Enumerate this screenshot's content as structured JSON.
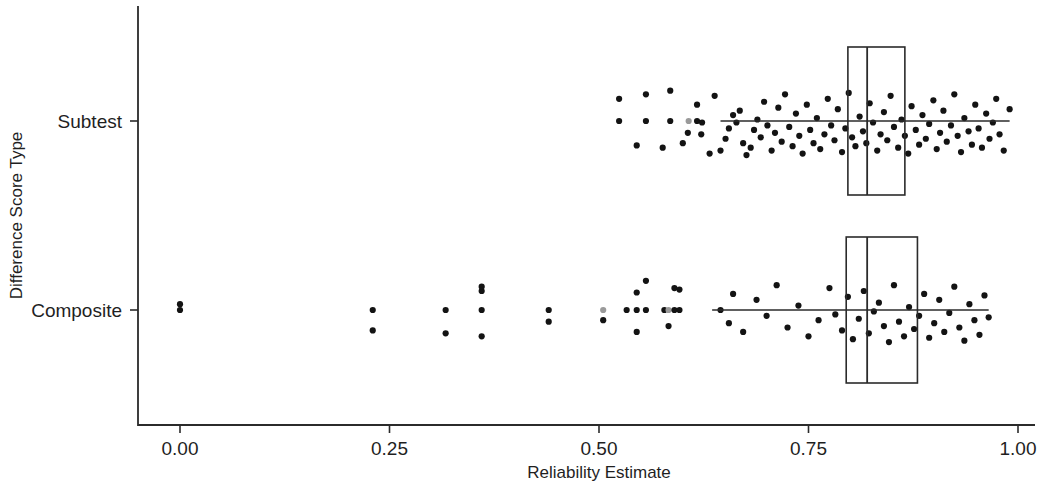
{
  "chart_data": {
    "type": "boxplot",
    "title": "",
    "xlabel": "Reliability Estimate",
    "ylabel": "Difference Score Type",
    "xlim": [
      -0.05,
      1.03
    ],
    "xticks": [
      0.0,
      0.25,
      0.5,
      0.75,
      1.0
    ],
    "xticklabels": [
      "0.00",
      "0.25",
      "0.50",
      "0.75",
      "1.00"
    ],
    "categories": [
      "Subtest",
      "Composite"
    ],
    "grid": false,
    "legend": "none",
    "point_color": "#131313",
    "line_color": "#2b2b2b",
    "box_fill": "none",
    "boxes": [
      {
        "category": "Subtest",
        "q1": 0.797,
        "median": 0.82,
        "q3": 0.865,
        "whisker_low": 0.645,
        "whisker_high": 0.99,
        "n_points": 430
      },
      {
        "category": "Composite",
        "q1": 0.795,
        "median": 0.82,
        "q3": 0.88,
        "whisker_low": 0.635,
        "whisker_high": 0.965,
        "n_points": 175
      }
    ],
    "points": {
      "Subtest": [
        [
          0.524,
          0.0
        ],
        [
          0.556,
          0.0
        ],
        [
          0.585,
          0.0
        ],
        [
          0.607,
          0.0
        ],
        [
          0.617,
          0.0
        ],
        [
          0.623,
          0.02
        ],
        [
          0.524,
          -0.3
        ],
        [
          0.556,
          -0.36
        ],
        [
          0.585,
          -0.41
        ],
        [
          0.617,
          -0.22
        ],
        [
          0.638,
          -0.34
        ],
        [
          0.545,
          0.33
        ],
        [
          0.576,
          0.36
        ],
        [
          0.6,
          0.3
        ],
        [
          0.606,
          0.16
        ],
        [
          0.622,
          0.18
        ],
        [
          0.632,
          0.44
        ],
        [
          0.645,
          0.4
        ],
        [
          0.651,
          0.24
        ],
        [
          0.655,
          0.1
        ],
        [
          0.66,
          -0.08
        ],
        [
          0.664,
          0.02
        ],
        [
          0.668,
          -0.14
        ],
        [
          0.672,
          0.3
        ],
        [
          0.676,
          0.46
        ],
        [
          0.681,
          0.36
        ],
        [
          0.685,
          0.12
        ],
        [
          0.689,
          -0.02
        ],
        [
          0.693,
          0.22
        ],
        [
          0.697,
          -0.26
        ],
        [
          0.701,
          0.06
        ],
        [
          0.706,
          0.4
        ],
        [
          0.71,
          0.16
        ],
        [
          0.714,
          -0.18
        ],
        [
          0.718,
          0.28
        ],
        [
          0.722,
          -0.36
        ],
        [
          0.727,
          0.08
        ],
        [
          0.731,
          0.34
        ],
        [
          0.735,
          -0.1
        ],
        [
          0.739,
          0.2
        ],
        [
          0.743,
          0.44
        ],
        [
          0.748,
          -0.22
        ],
        [
          0.752,
          0.12
        ],
        [
          0.756,
          0.3
        ],
        [
          0.76,
          -0.04
        ],
        [
          0.764,
          0.38
        ],
        [
          0.769,
          0.18
        ],
        [
          0.773,
          -0.3
        ],
        [
          0.777,
          0.06
        ],
        [
          0.781,
          0.26
        ],
        [
          0.785,
          -0.16
        ],
        [
          0.79,
          0.42
        ],
        [
          0.794,
          0.1
        ],
        [
          0.798,
          -0.38
        ],
        [
          0.802,
          0.22
        ],
        [
          0.806,
          0.34
        ],
        [
          0.811,
          -0.06
        ],
        [
          0.815,
          0.14
        ],
        [
          0.819,
          0.3
        ],
        [
          0.823,
          -0.24
        ],
        [
          0.827,
          0.02
        ],
        [
          0.832,
          0.4
        ],
        [
          0.836,
          0.18
        ],
        [
          0.84,
          -0.12
        ],
        [
          0.844,
          0.26
        ],
        [
          0.848,
          -0.34
        ],
        [
          0.852,
          0.08
        ],
        [
          0.857,
          0.36
        ],
        [
          0.861,
          -0.02
        ],
        [
          0.865,
          0.2
        ],
        [
          0.869,
          0.44
        ],
        [
          0.873,
          -0.2
        ],
        [
          0.878,
          0.12
        ],
        [
          0.882,
          0.32
        ],
        [
          0.886,
          -0.08
        ],
        [
          0.89,
          0.24
        ],
        [
          0.894,
          0.04
        ],
        [
          0.899,
          -0.28
        ],
        [
          0.903,
          0.38
        ],
        [
          0.907,
          0.16
        ],
        [
          0.911,
          -0.14
        ],
        [
          0.915,
          0.28
        ],
        [
          0.92,
          0.06
        ],
        [
          0.924,
          -0.36
        ],
        [
          0.928,
          0.2
        ],
        [
          0.932,
          0.42
        ],
        [
          0.936,
          -0.04
        ],
        [
          0.941,
          0.14
        ],
        [
          0.945,
          0.32
        ],
        [
          0.949,
          -0.22
        ],
        [
          0.953,
          0.1
        ],
        [
          0.957,
          0.36
        ],
        [
          0.962,
          -0.1
        ],
        [
          0.966,
          0.24
        ],
        [
          0.97,
          0.02
        ],
        [
          0.974,
          -0.3
        ],
        [
          0.978,
          0.18
        ],
        [
          0.983,
          0.4
        ],
        [
          0.99,
          -0.16
        ]
      ],
      "Composite": [
        [
          0.0,
          0.0
        ],
        [
          0.0,
          -0.08
        ],
        [
          0.23,
          0.0
        ],
        [
          0.23,
          0.28
        ],
        [
          0.317,
          0.0
        ],
        [
          0.317,
          0.32
        ],
        [
          0.36,
          0.0
        ],
        [
          0.36,
          0.36
        ],
        [
          0.36,
          -0.26
        ],
        [
          0.36,
          -0.32
        ],
        [
          0.44,
          0.0
        ],
        [
          0.44,
          0.16
        ],
        [
          0.505,
          0.0
        ],
        [
          0.505,
          0.14
        ],
        [
          0.533,
          0.0
        ],
        [
          0.545,
          0.0
        ],
        [
          0.556,
          0.0
        ],
        [
          0.545,
          0.3
        ],
        [
          0.545,
          -0.24
        ],
        [
          0.556,
          -0.4
        ],
        [
          0.578,
          0.0
        ],
        [
          0.583,
          0.0
        ],
        [
          0.59,
          0.0
        ],
        [
          0.596,
          0.0
        ],
        [
          0.583,
          0.22
        ],
        [
          0.596,
          -0.28
        ],
        [
          0.59,
          -0.3
        ],
        [
          0.645,
          0.0
        ],
        [
          0.655,
          0.18
        ],
        [
          0.66,
          -0.22
        ],
        [
          0.672,
          0.3
        ],
        [
          0.688,
          -0.14
        ],
        [
          0.7,
          0.08
        ],
        [
          0.712,
          -0.34
        ],
        [
          0.725,
          0.24
        ],
        [
          0.738,
          -0.06
        ],
        [
          0.75,
          0.36
        ],
        [
          0.762,
          0.14
        ],
        [
          0.775,
          -0.3
        ],
        [
          0.782,
          0.06
        ],
        [
          0.79,
          0.28
        ],
        [
          0.797,
          -0.18
        ],
        [
          0.803,
          0.4
        ],
        [
          0.81,
          0.12
        ],
        [
          0.816,
          -0.26
        ],
        [
          0.822,
          0.32
        ],
        [
          0.828,
          0.02
        ],
        [
          0.834,
          -0.1
        ],
        [
          0.84,
          0.22
        ],
        [
          0.846,
          0.44
        ],
        [
          0.852,
          -0.34
        ],
        [
          0.858,
          0.16
        ],
        [
          0.864,
          0.36
        ],
        [
          0.87,
          -0.04
        ],
        [
          0.876,
          0.26
        ],
        [
          0.882,
          0.08
        ],
        [
          0.888,
          -0.22
        ],
        [
          0.894,
          0.38
        ],
        [
          0.9,
          0.18
        ],
        [
          0.906,
          -0.14
        ],
        [
          0.912,
          0.3
        ],
        [
          0.918,
          0.04
        ],
        [
          0.924,
          -0.32
        ],
        [
          0.93,
          0.24
        ],
        [
          0.936,
          0.42
        ],
        [
          0.942,
          -0.08
        ],
        [
          0.948,
          0.14
        ],
        [
          0.954,
          0.34
        ],
        [
          0.96,
          -0.2
        ],
        [
          0.965,
          0.1
        ]
      ]
    }
  }
}
